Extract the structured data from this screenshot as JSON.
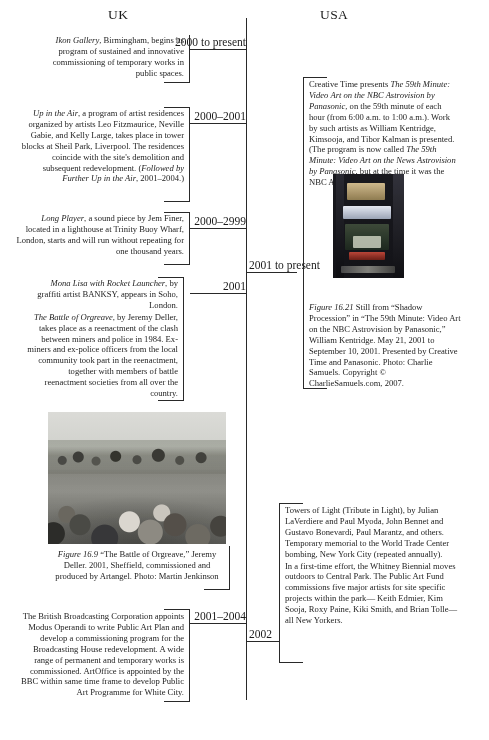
{
  "page": {
    "width": 489,
    "height": 740,
    "background": "#ffffff",
    "ink": "#1f1f1f"
  },
  "headers": {
    "left": "UK",
    "right": "USA"
  },
  "timeline": {
    "orientation": "vertical",
    "axis_color": "#2b2b2b",
    "dates": [
      {
        "id": "d1",
        "label": "2000 to present",
        "side": "left"
      },
      {
        "id": "d2",
        "label": "2000–2001",
        "side": "left"
      },
      {
        "id": "d3",
        "label": "2000–2999",
        "side": "left"
      },
      {
        "id": "d4",
        "label": "2001 to present",
        "side": "right"
      },
      {
        "id": "d5",
        "label": "2001",
        "side": "left"
      },
      {
        "id": "d6",
        "label": "2001–2004",
        "side": "left"
      },
      {
        "id": "d7",
        "label": "2002",
        "side": "right"
      }
    ]
  },
  "uk_entries": [
    {
      "id": "uk-ikon",
      "date": "2000 to present",
      "paragraphs": [
        "<i>Ikon Gallery</i>, Birmingham, begins its program of sustained and innovative commissioning of temporary works in public spaces."
      ]
    },
    {
      "id": "uk-upintheair",
      "date": "2000–2001",
      "paragraphs": [
        "<i>Up in the Air</i>, a program of artist residences organized by artists Leo Fitzmaurice, Neville Gabie, and Kelly Large, takes place in tower blocks at Sheil Park, Liverpool. The residences coincide with the site's demolition and subsequent redevelopment. (<i>Followed by Further Up in the Air</i>, 2001–2004.)"
      ]
    },
    {
      "id": "uk-longplayer",
      "date": "2000–2999",
      "paragraphs": [
        "<i>Long Player</i>, a sound piece by Jem Finer, located in a lighthouse at Trinity Buoy Wharf, London, starts and will run without repeating for one thousand years."
      ]
    },
    {
      "id": "uk-banksy-orgreave",
      "date": "2001",
      "paragraphs": [
        "<i>Mona Lisa with Rocket Launcher</i>, by graffiti artist BANKSY, appears in Soho, London.",
        "<i>The Battle of Orgreave</i>, by Jeremy Deller, takes place as a reenactment of the clash between miners and police in 1984. Ex-miners and ex-police officers from the local community took part in the reenactment, together with members of battle reenactment societies from all over the country."
      ]
    },
    {
      "id": "uk-bbc",
      "date": "2001–2004",
      "paragraphs": [
        "The British Broadcasting Corporation appoints Modus Operandi to write Public Art Plan and develop a commissioning program for the Broadcasting House redevelopment. A wide range of permanent and temporary works is commissioned. ArtOffice is appointed by the BBC within same time frame to develop Public Art Programme for White City."
      ]
    }
  ],
  "usa_entries": [
    {
      "id": "usa-creative-time",
      "date": "2001 to present",
      "paragraphs": [
        "Creative Time presents <i>The 59th Minute: Video Art on the NBC Astrovision by Panasonic</i>, on the 59th minute of each hour (from 6:00 a.m. to 1:00 a.m.). Work by such artists as William Kentridge, Kimsooja, and Tibor Kalman is presented. (The program is now called <i>The 59th Minute: Video Art on the News Astrovision by Panasonic</i>, but at the time it was the NBC Astrovision)."
      ]
    },
    {
      "id": "usa-towers-of-light",
      "date": "2002",
      "paragraphs": [
        "Towers of Light (Tribute in Light), by Julian LaVerdiere and Paul Myoda, John Bennet and Gustavo Bonevardi, Paul Marantz, and others. Temporary memorial to the World Trade Center bombing, New York City (repeated annually).",
        "In a first-time effort, the Whitney Biennial moves outdoors to Central Park. The Public Art Fund commissions five major artists for site specific projects within the park— Keith Edmier, Kim Sooja, Roxy Paine, Kiki Smith, and Brian Tolle— all New Yorkers."
      ]
    }
  ],
  "figures": [
    {
      "id": "fig-16-9",
      "label": "Figure 16.9",
      "caption": "“The Battle of Orgreave,” Jeremy Deller. 2001, Sheffield, commissioned and produced by Artangel.  Photo: Martin Jenkinson",
      "alt": "Black-and-white photograph of a crowd of people running toward the camera with mounted police behind them",
      "column": "UK"
    },
    {
      "id": "fig-16-21",
      "label": "Figure 16.21",
      "caption": "Still from “Shadow Procession” in “The 59th Minute: Video Art on the NBC Astrovision by Panasonic,” William Kentridge. May 21, 2001 to September 10, 2001. Presented by Creative Time and Panasonic. Photo: Charlie Samuels. Copyright © CharlieSamuels.com, 2007.",
      "alt": "Night photograph of Times Square buildings with illuminated billboards and a large video screen",
      "column": "USA"
    }
  ]
}
